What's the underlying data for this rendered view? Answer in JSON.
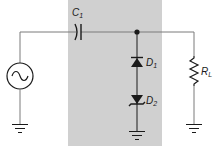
{
  "diagram": {
    "type": "circuit-schematic",
    "colors": {
      "background": "#ffffff",
      "highlight_box": "#d0d0d0",
      "wire": "#7a7a7a",
      "component": "#1a1a1a"
    },
    "components": [
      {
        "id": "source",
        "type": "ac-voltage-source",
        "label": ""
      },
      {
        "id": "C1",
        "type": "capacitor",
        "label": "C",
        "subscript": "1"
      },
      {
        "id": "D1",
        "type": "diode",
        "label": "D",
        "subscript": "1",
        "orientation": "anode-down"
      },
      {
        "id": "D2",
        "type": "zener-diode",
        "label": "D",
        "subscript": "2",
        "orientation": "anode-up"
      },
      {
        "id": "RL",
        "type": "resistor",
        "label": "R",
        "subscript": "L"
      },
      {
        "id": "gnd1",
        "type": "ground",
        "label": ""
      },
      {
        "id": "gnd2",
        "type": "ground",
        "label": ""
      },
      {
        "id": "gnd3",
        "type": "ground",
        "label": ""
      }
    ],
    "labels": {
      "c1_main": "C",
      "c1_sub": "1",
      "d1_main": "D",
      "d1_sub": "1",
      "d2_main": "D",
      "d2_sub": "2",
      "rl_main": "R",
      "rl_sub": "L"
    }
  }
}
